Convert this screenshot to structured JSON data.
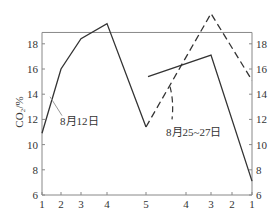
{
  "chart_data": {
    "type": "line",
    "title": "",
    "xlabel": "",
    "ylabel": "CO₂/%",
    "ylim": [
      6,
      19
    ],
    "y_ticks": [
      6,
      8,
      10,
      12,
      14,
      16,
      18
    ],
    "grid": false,
    "legend": "inline annotations",
    "x_tick_labels": [
      "1",
      "2",
      "3",
      "4",
      "5",
      "4",
      "3",
      "2",
      "1"
    ],
    "x_tick_positions": [
      1,
      2,
      3,
      4,
      5,
      6,
      7,
      8,
      9
    ],
    "series": [
      {
        "name": "8月12日",
        "style": "solid",
        "segments": [
          {
            "x": [
              1,
              2,
              3,
              4,
              5
            ],
            "y": [
              10.9,
              16.0,
              18.4,
              19.6,
              11.4
            ]
          },
          {
            "x": [
              5.05,
              7,
              9
            ],
            "y": [
              15.4,
              17.1,
              7.1
            ]
          }
        ]
      },
      {
        "name": "8月25~27日",
        "style": "dashed",
        "segments": [
          {
            "x": [
              5,
              7,
              9
            ],
            "y": [
              11.4,
              20.4,
              15.1
            ]
          }
        ]
      }
    ],
    "annotations": [
      {
        "text": "8月12日",
        "points_to": "solid line near x=2"
      },
      {
        "text": "8月25~27日",
        "points_to": "dashed line near x=6"
      }
    ]
  },
  "labels": {
    "ylabel": "CO₂/%",
    "ann1": "8月12日",
    "ann2": "8月25~27日"
  }
}
